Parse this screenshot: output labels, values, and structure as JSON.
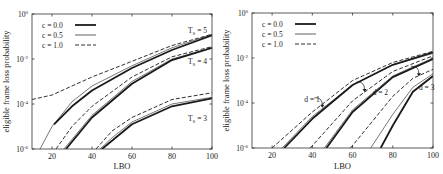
{
  "chart_data": [
    {
      "type": "line",
      "panel": "left",
      "title": "",
      "xlabel": "LBO",
      "ylabel": "eligible frame loss probability",
      "xlim": [
        10,
        100
      ],
      "ylim_log10": [
        -6,
        0
      ],
      "yscale": "log",
      "x_ticks": [
        20,
        40,
        60,
        80,
        100
      ],
      "y_ticks": [
        "10^0",
        "10^-2",
        "10^-4",
        "10^-6"
      ],
      "legend": [
        {
          "label": "c = 0.0",
          "style": "thick-solid"
        },
        {
          "label": "c = 0.5",
          "style": "thin-solid"
        },
        {
          "label": "c = 1.0",
          "style": "dashed"
        }
      ],
      "legend_position": "upper-left",
      "annotations": [
        {
          "text": "T_S = 5",
          "x": 88,
          "y_log10": -0.7
        },
        {
          "text": "T_S = 4",
          "x": 88,
          "y_log10": -2.1
        },
        {
          "text": "T_S = 3",
          "x": 88,
          "y_log10": -4.6
        }
      ],
      "series": [
        {
          "name": "Ts=5, c=1.0",
          "style": "dashed",
          "x": [
            10,
            20,
            30,
            40,
            60,
            80,
            100
          ],
          "y_log10": [
            -3.8,
            -3.6,
            -3.2,
            -2.8,
            -2.1,
            -1.4,
            -0.9
          ]
        },
        {
          "name": "Ts=5, c=0.5",
          "style": "thin",
          "x": [
            14,
            20,
            30,
            40,
            60,
            80,
            100
          ],
          "y_log10": [
            -6,
            -5.0,
            -3.9,
            -3.2,
            -2.3,
            -1.5,
            -0.9
          ]
        },
        {
          "name": "Ts=5, c=0.0",
          "style": "thick",
          "x": [
            21,
            30,
            40,
            60,
            80,
            100
          ],
          "y_log10": [
            -4.9,
            -4.1,
            -3.4,
            -2.4,
            -1.6,
            -0.95
          ]
        },
        {
          "name": "Ts=4, c=1.0",
          "style": "dashed",
          "x": [
            22,
            30,
            40,
            60,
            80,
            100
          ],
          "y_log10": [
            -6,
            -5.0,
            -4.1,
            -2.8,
            -1.9,
            -1.45
          ]
        },
        {
          "name": "Ts=4, c=0.5",
          "style": "thin",
          "x": [
            26,
            40,
            60,
            80,
            100
          ],
          "y_log10": [
            -6,
            -4.5,
            -3.0,
            -2.0,
            -1.5
          ]
        },
        {
          "name": "Ts=4, c=0.0",
          "style": "thick",
          "x": [
            27,
            40,
            60,
            80,
            100
          ],
          "y_log10": [
            -6,
            -4.6,
            -3.1,
            -2.05,
            -1.5
          ]
        },
        {
          "name": "Ts=3, c=1.0",
          "style": "dashed",
          "x": [
            42,
            50,
            60,
            80,
            100
          ],
          "y_log10": [
            -6,
            -5.2,
            -4.6,
            -3.8,
            -3.5
          ]
        },
        {
          "name": "Ts=3, c=0.5",
          "style": "thin",
          "x": [
            44,
            50,
            60,
            80,
            100
          ],
          "y_log10": [
            -6,
            -5.5,
            -4.8,
            -4.0,
            -3.7
          ]
        },
        {
          "name": "Ts=3, c=0.0",
          "style": "thick",
          "x": [
            45,
            60,
            80,
            100
          ],
          "y_log10": [
            -6,
            -4.9,
            -4.1,
            -3.75
          ]
        }
      ]
    },
    {
      "type": "line",
      "panel": "right",
      "title": "",
      "xlabel": "LBO",
      "ylabel": "eligible frame loss probability",
      "xlim": [
        10,
        100
      ],
      "ylim_log10": [
        -6,
        0
      ],
      "yscale": "log",
      "x_ticks": [
        20,
        40,
        60,
        80,
        100
      ],
      "y_ticks": [
        "10^0",
        "10^-2",
        "10^-4",
        "10^-6"
      ],
      "legend": [
        {
          "label": "c = 0.0",
          "style": "thick-solid"
        },
        {
          "label": "c = 0.5",
          "style": "thin-solid"
        },
        {
          "label": "c = 1.0",
          "style": "dashed"
        }
      ],
      "legend_position": "upper-left",
      "annotations": [
        {
          "text": "d = 1",
          "x": 40,
          "y_log10": -3.8
        },
        {
          "text": "d = 2",
          "x": 69,
          "y_log10": -3.5
        },
        {
          "text": "d = 3",
          "x": 92,
          "y_log10": -3.3
        }
      ],
      "series": [
        {
          "name": "d=1, c=1.0",
          "style": "dashed",
          "x": [
            20,
            30,
            40,
            60,
            80,
            100
          ],
          "y_log10": [
            -6,
            -5.2,
            -4.4,
            -3.0,
            -2.2,
            -1.7
          ]
        },
        {
          "name": "d=1, c=0.5",
          "style": "thin",
          "x": [
            25,
            40,
            60,
            80,
            100
          ],
          "y_log10": [
            -6,
            -4.6,
            -3.2,
            -2.3,
            -1.8
          ]
        },
        {
          "name": "d=1, c=0.0",
          "style": "thick",
          "x": [
            26,
            40,
            60,
            80,
            100
          ],
          "y_log10": [
            -6,
            -4.7,
            -3.2,
            -2.3,
            -1.75
          ]
        },
        {
          "name": "d=2, c=1.0",
          "style": "dashed",
          "x": [
            39,
            50,
            60,
            80,
            100
          ],
          "y_log10": [
            -6,
            -4.9,
            -3.9,
            -2.6,
            -1.9
          ]
        },
        {
          "name": "d=2, c=0.5",
          "style": "thin",
          "x": [
            46,
            60,
            80,
            100
          ],
          "y_log10": [
            -6,
            -4.3,
            -2.8,
            -2.0
          ]
        },
        {
          "name": "d=2, c=0.0",
          "style": "thick",
          "x": [
            47,
            60,
            80,
            100
          ],
          "y_log10": [
            -6,
            -4.4,
            -2.85,
            -2.05
          ]
        },
        {
          "name": "d=3, c=1.0",
          "style": "dashed",
          "x": [
            59,
            70,
            80,
            90,
            100
          ],
          "y_log10": [
            -6,
            -4.8,
            -3.7,
            -2.9,
            -2.5
          ]
        },
        {
          "name": "d=3, c=0.5",
          "style": "thin",
          "x": [
            69,
            80,
            90,
            100
          ],
          "y_log10": [
            -6,
            -4.5,
            -3.3,
            -2.7
          ]
        },
        {
          "name": "d=3, c=0.0",
          "style": "thick",
          "x": [
            74,
            80,
            90,
            100
          ],
          "y_log10": [
            -6,
            -5.0,
            -3.5,
            -2.8
          ]
        }
      ]
    }
  ],
  "labels": {
    "xlabel": "LBO",
    "ylabel": "eligible frame loss probability",
    "ytick_base": "10",
    "ytick_exps": [
      "0",
      "-2",
      "-4",
      "-6"
    ],
    "xticks": [
      "20",
      "40",
      "60",
      "80",
      "100"
    ],
    "legend": [
      "c = 0.0",
      "c = 0.5",
      "c = 1.0"
    ],
    "left_annotations": [
      "T",
      "S",
      " = 5",
      " = 4",
      " = 3"
    ],
    "right_annotations": [
      "d = 1",
      "d = 2",
      "d = 3"
    ]
  },
  "colors": {
    "line": "#1a1a1a",
    "axis": "#333333",
    "background": "#ffffff"
  }
}
